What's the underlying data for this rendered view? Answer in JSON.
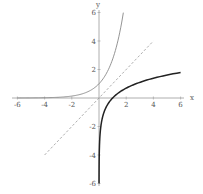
{
  "chart_data": {
    "type": "line",
    "title": "",
    "xlabel": "x",
    "ylabel": "y",
    "xlim": [
      -6,
      6
    ],
    "ylim": [
      -6,
      6
    ],
    "grid": false,
    "legend": null,
    "x_ticks": [
      "-6",
      "-4",
      "-2",
      "2",
      "4",
      "6"
    ],
    "y_ticks": [
      "6",
      "4",
      "2",
      "-2",
      "-4",
      "-6"
    ],
    "series": [
      {
        "name": "y = e^x",
        "style": "thin gray solid",
        "color": "#888888",
        "x": [
          -6,
          -4,
          -2,
          -1,
          0,
          1,
          1.5,
          1.79
        ],
        "y": [
          0.0025,
          0.018,
          0.135,
          0.368,
          1,
          2.718,
          4.48,
          6
        ]
      },
      {
        "name": "y = ln x",
        "style": "thick black solid",
        "color": "#222222",
        "x": [
          0.0025,
          0.05,
          0.2,
          0.5,
          1,
          2,
          4,
          6
        ],
        "y": [
          -6,
          -3.0,
          -1.61,
          -0.69,
          0,
          0.69,
          1.39,
          1.79
        ]
      },
      {
        "name": "y = x",
        "style": "gray dashed",
        "color": "#999999",
        "x": [
          -4,
          4
        ],
        "y": [
          -4,
          4
        ]
      }
    ]
  }
}
